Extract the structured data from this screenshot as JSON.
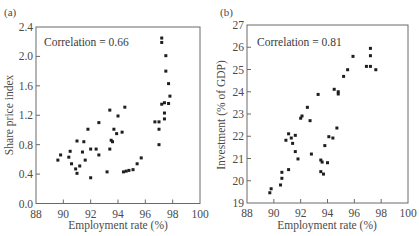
{
  "chart_data": [
    {
      "type": "scatter",
      "panel_label": "(a)",
      "title": "",
      "annotation": "Correlation = 0.66",
      "xlabel": "Employment rate (%)",
      "ylabel": "Share price index",
      "xlim": [
        88,
        100
      ],
      "ylim": [
        0.0,
        2.4
      ],
      "xticks": [
        88,
        90,
        92,
        94,
        96,
        98,
        100
      ],
      "yticks": [
        0.0,
        0.4,
        0.8,
        1.2,
        1.6,
        2.0,
        2.4
      ],
      "ytick_labels": [
        "0.0",
        "0.4",
        "0.8",
        "1.2",
        "1.6",
        "2.0",
        "2.4"
      ],
      "grid": false,
      "legend": "none",
      "points": [
        [
          89.6,
          0.59
        ],
        [
          89.8,
          0.66
        ],
        [
          90.4,
          0.63
        ],
        [
          90.5,
          0.71
        ],
        [
          90.6,
          0.54
        ],
        [
          90.9,
          0.47
        ],
        [
          91.0,
          0.41
        ],
        [
          91.0,
          0.85
        ],
        [
          91.2,
          0.51
        ],
        [
          91.4,
          0.7
        ],
        [
          91.5,
          0.84
        ],
        [
          91.6,
          0.59
        ],
        [
          91.8,
          1.01
        ],
        [
          92.0,
          0.74
        ],
        [
          92.0,
          0.35
        ],
        [
          92.4,
          0.74
        ],
        [
          92.6,
          0.66
        ],
        [
          92.6,
          1.1
        ],
        [
          93.2,
          0.43
        ],
        [
          93.4,
          0.74
        ],
        [
          93.4,
          1.27
        ],
        [
          93.5,
          0.86
        ],
        [
          93.6,
          0.84
        ],
        [
          93.7,
          1.01
        ],
        [
          93.9,
          0.95
        ],
        [
          94.0,
          1.19
        ],
        [
          94.3,
          0.97
        ],
        [
          94.4,
          0.43
        ],
        [
          94.5,
          1.31
        ],
        [
          94.6,
          0.44
        ],
        [
          94.8,
          0.45
        ],
        [
          95.1,
          0.46
        ],
        [
          95.4,
          0.54
        ],
        [
          95.7,
          0.62
        ],
        [
          96.7,
          1.11
        ],
        [
          97.0,
          1.11
        ],
        [
          97.0,
          1.01
        ],
        [
          97.0,
          0.8
        ],
        [
          97.2,
          2.25
        ],
        [
          97.2,
          2.19
        ],
        [
          97.2,
          1.35
        ],
        [
          97.4,
          1.23
        ],
        [
          97.4,
          1.15
        ],
        [
          97.4,
          1.37
        ],
        [
          97.5,
          2.01
        ],
        [
          97.5,
          1.8
        ],
        [
          97.7,
          1.36
        ],
        [
          97.7,
          1.63
        ],
        [
          97.8,
          1.46
        ]
      ]
    },
    {
      "type": "scatter",
      "panel_label": "(b)",
      "title": "",
      "annotation": "Correlation = 0.81",
      "xlabel": "Employment rate (%)",
      "ylabel": "Investment (% of GDP)",
      "xlim": [
        88,
        100
      ],
      "ylim": [
        19,
        27
      ],
      "xticks": [
        88,
        90,
        92,
        94,
        96,
        98,
        100
      ],
      "yticks": [
        19,
        20,
        21,
        22,
        23,
        24,
        25,
        26,
        27
      ],
      "ytick_labels": [
        "19",
        "20",
        "21",
        "22",
        "23",
        "24",
        "25",
        "26",
        "27"
      ],
      "grid": false,
      "legend": "none",
      "points": [
        [
          89.7,
          19.46
        ],
        [
          89.8,
          19.64
        ],
        [
          90.5,
          19.81
        ],
        [
          90.6,
          20.11
        ],
        [
          90.6,
          20.38
        ],
        [
          91.1,
          20.5
        ],
        [
          90.9,
          21.82
        ],
        [
          91.1,
          22.11
        ],
        [
          91.3,
          21.92
        ],
        [
          91.4,
          21.68
        ],
        [
          91.6,
          22.04
        ],
        [
          91.6,
          21.31
        ],
        [
          91.8,
          20.98
        ],
        [
          92.0,
          22.81
        ],
        [
          92.1,
          22.91
        ],
        [
          92.5,
          23.3
        ],
        [
          92.7,
          22.7
        ],
        [
          92.8,
          21.2
        ],
        [
          93.3,
          23.88
        ],
        [
          93.5,
          20.93
        ],
        [
          93.6,
          20.84
        ],
        [
          93.5,
          20.41
        ],
        [
          93.7,
          20.3
        ],
        [
          93.8,
          21.58
        ],
        [
          94.0,
          20.81
        ],
        [
          94.1,
          21.98
        ],
        [
          94.4,
          21.92
        ],
        [
          94.7,
          22.37
        ],
        [
          94.5,
          24.11
        ],
        [
          94.8,
          24.0
        ],
        [
          94.8,
          23.9
        ],
        [
          95.2,
          24.69
        ],
        [
          95.5,
          24.99
        ],
        [
          95.9,
          25.59
        ],
        [
          96.9,
          25.14
        ],
        [
          97.2,
          25.95
        ],
        [
          97.2,
          25.62
        ],
        [
          97.2,
          25.14
        ],
        [
          97.6,
          24.99
        ]
      ]
    }
  ]
}
